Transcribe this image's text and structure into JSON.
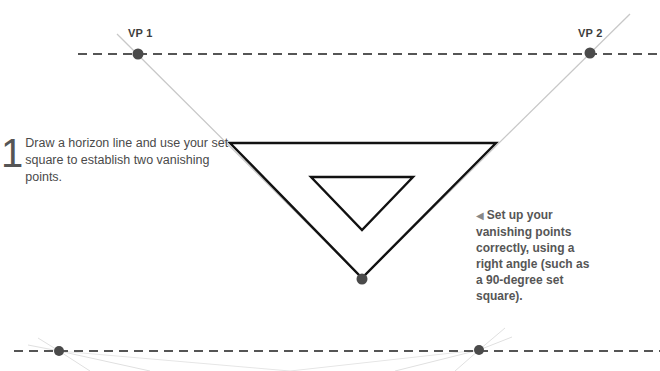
{
  "diagram": {
    "vanishing_points": [
      {
        "label": "VP 1",
        "x": 138,
        "y": 54
      },
      {
        "label": "VP 2",
        "x": 590,
        "y": 53
      }
    ],
    "bottom_vertex": {
      "x": 362,
      "y": 278
    },
    "horizon_top": {
      "y": 54,
      "x_start": 78,
      "x_end": 660
    },
    "horizon_bottom": {
      "y": 351,
      "x_start": 14,
      "x_end": 660,
      "points": [
        {
          "x": 59,
          "y": 351
        },
        {
          "x": 479,
          "y": 350
        }
      ]
    },
    "colors": {
      "dot": "#4a4a4a",
      "dash": "#555555",
      "construction": "#c8c8c8",
      "outline": "#111111"
    }
  },
  "step": {
    "number": "1",
    "text": "Draw a horizon line and use your set square to establish two vanishing points."
  },
  "caption": {
    "arrow": "◀",
    "text": "Set up your vanishing points correctly, using a right angle (such as a 90-degree set square)."
  }
}
